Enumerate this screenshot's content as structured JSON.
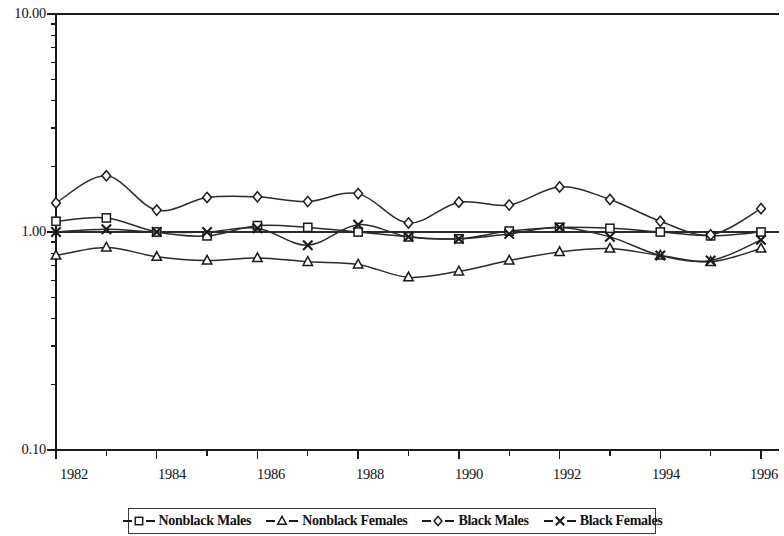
{
  "chart_data": {
    "type": "line",
    "title": "",
    "subtitle": "",
    "xlabel": "",
    "ylabel": "",
    "yscale": "log",
    "ylim": [
      0.1,
      10.0
    ],
    "xlim": [
      1982,
      1996
    ],
    "grid": false,
    "gridline_at": 1.0,
    "legend_position": "bottom",
    "y_tick_labels": [
      "10.00",
      "1.00",
      "0.10"
    ],
    "y_tick_values": [
      10.0,
      1.0,
      0.1
    ],
    "x_tick_labels": [
      "1982",
      "1984",
      "1986",
      "1988",
      "1990",
      "1992",
      "1994",
      "1996"
    ],
    "x_tick_values": [
      1982,
      1984,
      1986,
      1988,
      1990,
      1992,
      1994,
      1996
    ],
    "x_minor_ticks": [
      1983,
      1985,
      1987,
      1989,
      1991,
      1993,
      1995
    ],
    "x": [
      1982,
      1983,
      1984,
      1985,
      1986,
      1987,
      1988,
      1989,
      1990,
      1991,
      1992,
      1993,
      1994,
      1995,
      1996
    ],
    "series": [
      {
        "name": "Nonblack Males",
        "marker": "square",
        "values": [
          1.12,
          1.16,
          1.0,
          0.96,
          1.07,
          1.05,
          1.0,
          0.95,
          0.93,
          1.01,
          1.05,
          1.04,
          1.0,
          0.96,
          1.0
        ]
      },
      {
        "name": "Nonblack Females",
        "marker": "triangle",
        "values": [
          0.78,
          0.85,
          0.77,
          0.74,
          0.76,
          0.73,
          0.71,
          0.62,
          0.66,
          0.74,
          0.81,
          0.84,
          0.78,
          0.73,
          0.84
        ]
      },
      {
        "name": "Black Males",
        "marker": "diamond",
        "values": [
          1.36,
          1.81,
          1.26,
          1.44,
          1.45,
          1.38,
          1.5,
          1.1,
          1.37,
          1.33,
          1.61,
          1.41,
          1.12,
          0.97,
          1.28
        ]
      },
      {
        "name": "Black Females",
        "marker": "x",
        "values": [
          1.0,
          1.03,
          1.0,
          1.0,
          1.04,
          0.87,
          1.08,
          0.95,
          0.93,
          0.98,
          1.05,
          0.95,
          0.78,
          0.74,
          0.92
        ]
      }
    ]
  },
  "legend": {
    "items": [
      {
        "label": "Nonblack Males",
        "marker": "square"
      },
      {
        "label": "Nonblack Females",
        "marker": "triangle"
      },
      {
        "label": "Black Males",
        "marker": "diamond"
      },
      {
        "label": "Black Females",
        "marker": "x"
      }
    ]
  },
  "axes": {
    "y_labels": [
      "10.00",
      "1.00",
      "0.10"
    ],
    "x_labels": [
      "1982",
      "1984",
      "1986",
      "1988",
      "1990",
      "1992",
      "1994",
      "1996"
    ]
  }
}
